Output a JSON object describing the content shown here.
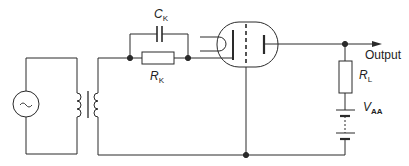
{
  "diagram": {
    "type": "vacuum tube amplifier circuit (cathode bias, transformer-coupled input)",
    "labels": {
      "cathode_capacitor": {
        "symbol": "C",
        "subscript": "K"
      },
      "cathode_resistor": {
        "symbol": "R",
        "subscript": "K"
      },
      "load_resistor": {
        "symbol": "R",
        "subscript": "L"
      },
      "supply_voltage": {
        "symbol": "V",
        "subscript": "AA"
      },
      "output": "Output"
    },
    "source_symbol": "~",
    "components": [
      {
        "id": "ac-source",
        "kind": "AC voltage source"
      },
      {
        "id": "input-transformer",
        "kind": "transformer (iron core)"
      },
      {
        "id": "cathode-resistor",
        "kind": "resistor",
        "label": "R_K"
      },
      {
        "id": "cathode-capacitor",
        "kind": "capacitor",
        "label": "C_K"
      },
      {
        "id": "triode",
        "kind": "vacuum tube (heater, cathode, grid, plate)"
      },
      {
        "id": "load-resistor",
        "kind": "resistor",
        "label": "R_L"
      },
      {
        "id": "battery",
        "kind": "DC supply",
        "label": "V_AA"
      }
    ],
    "colors": {
      "line": "#2a2a2a",
      "background": "#ffffff"
    }
  }
}
